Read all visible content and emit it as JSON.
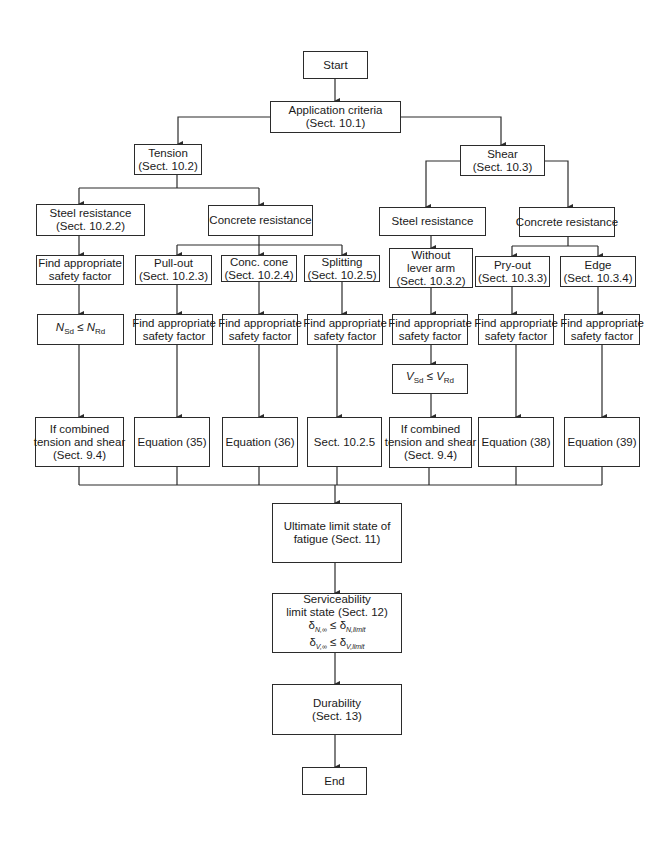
{
  "flowchart": {
    "start": {
      "label": "Start"
    },
    "application": {
      "line1": "Application criteria",
      "line2": "(Sect. 10.1)"
    },
    "tension": {
      "title": {
        "line1": "Tension",
        "line2": "(Sect. 10.2)"
      },
      "steel_resistance": {
        "line1": "Steel resistance",
        "line2": "(Sect. 10.2.2)"
      },
      "concrete_resistance": {
        "label": "Concrete resistance"
      },
      "steel_safety": {
        "line1": "Find appropriate",
        "line2": "safety factor"
      },
      "steel_check": {
        "lhs": "N",
        "lhs_sub": "Sd",
        "op": "≤",
        "rhs": "N",
        "rhs_sub": "Rd"
      },
      "steel_result": {
        "line1": "If combined",
        "line2": "tension and shear",
        "line3": "(Sect. 9.4)"
      },
      "pullout": {
        "box": {
          "line1": "Pull-out",
          "line2": "(Sect. 10.2.3)"
        },
        "safety": {
          "line1": "Find appropriate",
          "line2": "safety factor"
        },
        "result": {
          "label": "Equation (35)"
        }
      },
      "conc_cone": {
        "box": {
          "line1": "Conc. cone",
          "line2": "(Sect. 10.2.4)"
        },
        "safety": {
          "line1": "Find appropriate",
          "line2": "safety factor"
        },
        "result": {
          "label": "Equation (36)"
        }
      },
      "splitting": {
        "box": {
          "line1": "Splitting",
          "line2": "(Sect. 10.2.5)"
        },
        "safety": {
          "line1": "Find appropriate",
          "line2": "safety factor"
        },
        "result": {
          "label": "Sect. 10.2.5"
        }
      }
    },
    "shear": {
      "title": {
        "line1": "Shear",
        "line2": "(Sect. 10.3)"
      },
      "steel_resistance": {
        "label": "Steel resistance"
      },
      "concrete_resistance": {
        "label": "Concrete resistance"
      },
      "without_lever": {
        "box": {
          "line1": "Without",
          "line2": "lever arm",
          "line3": "(Sect. 10.3.2)"
        },
        "safety": {
          "line1": "Find appropriate",
          "line2": "safety factor"
        },
        "check": {
          "lhs": "V",
          "lhs_sub": "Sd",
          "op": "≤",
          "rhs": "V",
          "rhs_sub": "Rd"
        },
        "result": {
          "line1": "If combined",
          "line2": "tension and shear",
          "line3": "(Sect. 9.4)"
        }
      },
      "pryout": {
        "box": {
          "line1": "Pry-out",
          "line2": "(Sect. 10.3.3)"
        },
        "safety": {
          "line1": "Find appropriate",
          "line2": "safety factor"
        },
        "result": {
          "label": "Equation (38)"
        }
      },
      "edge": {
        "box": {
          "line1": "Edge",
          "line2": "(Sect. 10.3.4)"
        },
        "safety": {
          "line1": "Find appropriate",
          "line2": "safety factor"
        },
        "result": {
          "label": "Equation (39)"
        }
      }
    },
    "fatigue": {
      "line1": "Ultimate limit state of",
      "line2": "fatigue (Sect. 11)"
    },
    "serviceability": {
      "line1": "Serviceability",
      "line2": "limit state (Sect. 12)",
      "cond1": {
        "lhs": "δ",
        "lhs_sub": "N,∞",
        "op": "≤",
        "rhs": "δ",
        "rhs_sub": "N,limit"
      },
      "cond2": {
        "lhs": "δ",
        "lhs_sub": "V,∞",
        "op": "≤",
        "rhs": "δ",
        "rhs_sub": "V,limit"
      }
    },
    "durability": {
      "line1": "Durability",
      "line2": "(Sect. 13)"
    },
    "end": {
      "label": "End"
    }
  },
  "colors": {
    "line": "#2b2b2b",
    "background": "#ffffff"
  }
}
